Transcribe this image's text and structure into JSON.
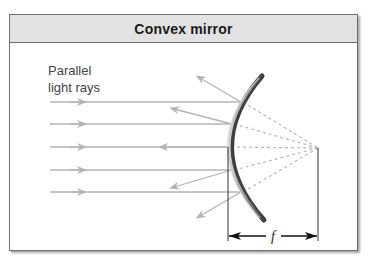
{
  "title": "Convex mirror",
  "label": {
    "line1": "Parallel",
    "line2": "light rays"
  },
  "focal_label": "f",
  "colors": {
    "ray": "#b4b4b4",
    "virtual_ray": "#b8b8b8",
    "mirror_dark": "#5a5a5a",
    "mirror_light": "#c8c8c8",
    "header_bg": "#e2e2e2",
    "border": "#6e6e6e",
    "dimension": "#1a1a1a"
  }
}
